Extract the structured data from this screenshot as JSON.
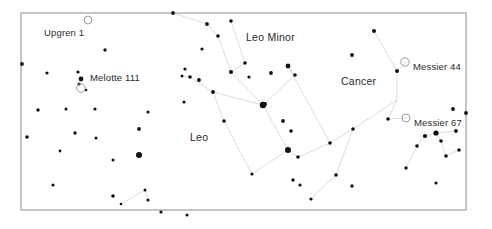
{
  "chart_data": {
    "type": "scatter",
    "title": "",
    "xlabel": "",
    "ylabel": "",
    "grid": false,
    "legend": null,
    "frame": {
      "x": 21,
      "y": 13,
      "width": 445,
      "height": 197
    },
    "xlim": [
      21,
      466
    ],
    "ylim": [
      13,
      210
    ],
    "constellation_labels": [
      {
        "name": "Leo Minor",
        "x": 246,
        "y": 41
      },
      {
        "name": "Cancer",
        "x": 341,
        "y": 85
      },
      {
        "name": "Leo",
        "x": 190,
        "y": 141
      }
    ],
    "object_labels": [
      {
        "name": "Upgren 1",
        "x": 44,
        "y": 36,
        "marker_x": 88,
        "marker_y": 20,
        "marker": "open-circle",
        "marker_r": 4.0
      },
      {
        "name": "Melotte 111",
        "x": 90,
        "y": 81,
        "marker_x": 81,
        "marker_y": 88,
        "marker": "open-circle",
        "marker_r": 4.2
      },
      {
        "name": "Messier 44",
        "x": 413,
        "y": 70,
        "marker_x": 405,
        "marker_y": 62,
        "marker": "open-circle",
        "marker_r": 4.2
      },
      {
        "name": "Messier 67",
        "x": 414,
        "y": 126,
        "marker_x": 406,
        "marker_y": 118,
        "marker": "open-circle",
        "marker_r": 4.0
      }
    ],
    "stars": [
      {
        "x": 22,
        "y": 64,
        "r": 1.9
      },
      {
        "x": 47,
        "y": 73,
        "r": 1.6
      },
      {
        "x": 38,
        "y": 110,
        "r": 1.7
      },
      {
        "x": 78,
        "y": 72,
        "r": 1.6
      },
      {
        "x": 81,
        "y": 79,
        "r": 2.4
      },
      {
        "x": 79,
        "y": 84,
        "r": 1.6
      },
      {
        "x": 86,
        "y": 90,
        "r": 1.3
      },
      {
        "x": 105,
        "y": 50,
        "r": 1.7
      },
      {
        "x": 95,
        "y": 109,
        "r": 1.6
      },
      {
        "x": 66,
        "y": 109,
        "r": 1.5
      },
      {
        "x": 27,
        "y": 137,
        "r": 1.8
      },
      {
        "x": 75,
        "y": 133,
        "r": 1.7
      },
      {
        "x": 96,
        "y": 138,
        "r": 1.5
      },
      {
        "x": 53,
        "y": 185,
        "r": 1.6
      },
      {
        "x": 113,
        "y": 196,
        "r": 1.8
      },
      {
        "x": 121,
        "y": 204,
        "r": 1.3
      },
      {
        "x": 148,
        "y": 200,
        "r": 1.6
      },
      {
        "x": 145,
        "y": 190,
        "r": 1.5
      },
      {
        "x": 139,
        "y": 155,
        "r": 3.0
      },
      {
        "x": 139,
        "y": 129,
        "r": 1.9
      },
      {
        "x": 148,
        "y": 112,
        "r": 1.6
      },
      {
        "x": 173,
        "y": 13,
        "r": 1.9
      },
      {
        "x": 184,
        "y": 102,
        "r": 1.6
      },
      {
        "x": 207,
        "y": 24,
        "r": 1.9
      },
      {
        "x": 231,
        "y": 21,
        "r": 1.8
      },
      {
        "x": 218,
        "y": 36,
        "r": 1.8
      },
      {
        "x": 202,
        "y": 49,
        "r": 1.6
      },
      {
        "x": 185,
        "y": 69,
        "r": 1.6
      },
      {
        "x": 182,
        "y": 76,
        "r": 1.5
      },
      {
        "x": 190,
        "y": 77,
        "r": 1.8
      },
      {
        "x": 199,
        "y": 80,
        "r": 1.9
      },
      {
        "x": 213,
        "y": 92,
        "r": 1.9
      },
      {
        "x": 224,
        "y": 121,
        "r": 1.8
      },
      {
        "x": 231,
        "y": 72,
        "r": 2.0
      },
      {
        "x": 245,
        "y": 63,
        "r": 1.8
      },
      {
        "x": 249,
        "y": 77,
        "r": 1.6
      },
      {
        "x": 263,
        "y": 105,
        "r": 3.2
      },
      {
        "x": 265,
        "y": 104,
        "r": 2.0
      },
      {
        "x": 271,
        "y": 73,
        "r": 1.9
      },
      {
        "x": 288,
        "y": 66,
        "r": 2.4
      },
      {
        "x": 295,
        "y": 75,
        "r": 1.8
      },
      {
        "x": 283,
        "y": 121,
        "r": 1.9
      },
      {
        "x": 288,
        "y": 150,
        "r": 3.0
      },
      {
        "x": 293,
        "y": 180,
        "r": 1.7
      },
      {
        "x": 300,
        "y": 185,
        "r": 1.6
      },
      {
        "x": 311,
        "y": 199,
        "r": 1.6
      },
      {
        "x": 291,
        "y": 131,
        "r": 1.8
      },
      {
        "x": 298,
        "y": 157,
        "r": 1.8
      },
      {
        "x": 330,
        "y": 143,
        "r": 1.8
      },
      {
        "x": 353,
        "y": 129,
        "r": 1.8
      },
      {
        "x": 336,
        "y": 175,
        "r": 1.8
      },
      {
        "x": 352,
        "y": 186,
        "r": 1.7
      },
      {
        "x": 374,
        "y": 31,
        "r": 2.0
      },
      {
        "x": 352,
        "y": 55,
        "r": 1.9
      },
      {
        "x": 397,
        "y": 71,
        "r": 2.0
      },
      {
        "x": 388,
        "y": 119,
        "r": 1.8
      },
      {
        "x": 406,
        "y": 168,
        "r": 1.7
      },
      {
        "x": 417,
        "y": 146,
        "r": 1.8
      },
      {
        "x": 425,
        "y": 136,
        "r": 2.1
      },
      {
        "x": 436,
        "y": 133,
        "r": 2.6
      },
      {
        "x": 441,
        "y": 141,
        "r": 1.8
      },
      {
        "x": 446,
        "y": 156,
        "r": 1.8
      },
      {
        "x": 456,
        "y": 131,
        "r": 1.9
      },
      {
        "x": 459,
        "y": 150,
        "r": 1.8
      },
      {
        "x": 436,
        "y": 183,
        "r": 1.6
      },
      {
        "x": 453,
        "y": 109,
        "r": 1.9
      },
      {
        "x": 466,
        "y": 113,
        "r": 1.9
      },
      {
        "x": 161,
        "y": 212,
        "r": 1.6
      },
      {
        "x": 187,
        "y": 215,
        "r": 1.5
      },
      {
        "x": 252,
        "y": 174,
        "r": 1.6
      },
      {
        "x": 113,
        "y": 160,
        "r": 1.5
      },
      {
        "x": 60,
        "y": 151,
        "r": 1.4
      }
    ],
    "constellation_lines": [
      {
        "name": "leo-sickle",
        "points": [
          [
            207,
            24
          ],
          [
            218,
            36
          ],
          [
            231,
            72
          ],
          [
            245,
            63
          ],
          [
            231,
            21
          ]
        ]
      },
      {
        "name": "leo-body-a",
        "points": [
          [
            231,
            72
          ],
          [
            263,
            105
          ],
          [
            288,
            150
          ]
        ]
      },
      {
        "name": "leo-body-b",
        "points": [
          [
            263,
            105
          ],
          [
            213,
            92
          ],
          [
            190,
            77
          ],
          [
            182,
            76
          ]
        ]
      },
      {
        "name": "leo-tail",
        "points": [
          [
            288,
            150
          ],
          [
            298,
            157
          ],
          [
            330,
            143
          ],
          [
            288,
            66
          ]
        ]
      },
      {
        "name": "leo-lower",
        "points": [
          [
            213,
            92
          ],
          [
            224,
            121
          ],
          [
            252,
            174
          ],
          [
            288,
            150
          ]
        ]
      },
      {
        "name": "leo-minor-line",
        "points": [
          [
            173,
            13
          ],
          [
            207,
            24
          ]
        ]
      },
      {
        "name": "leo-minor-arc",
        "points": [
          [
            263,
            105
          ],
          [
            295,
            75
          ],
          [
            288,
            66
          ]
        ]
      },
      {
        "name": "cancer-spine",
        "points": [
          [
            374,
            31
          ],
          [
            397,
            71
          ],
          [
            397,
            100
          ],
          [
            388,
            119
          ]
        ]
      },
      {
        "name": "cancer-branch-a",
        "points": [
          [
            397,
            71
          ],
          [
            406,
            62
          ]
        ]
      },
      {
        "name": "cancer-branch-b",
        "points": [
          [
            397,
            100
          ],
          [
            353,
            129
          ],
          [
            330,
            143
          ]
        ]
      },
      {
        "name": "cancer-branch-c",
        "points": [
          [
            388,
            119
          ],
          [
            406,
            118
          ]
        ]
      },
      {
        "name": "m67-chain",
        "points": [
          [
            406,
            168
          ],
          [
            417,
            146
          ],
          [
            425,
            136
          ],
          [
            436,
            133
          ],
          [
            456,
            131
          ]
        ]
      },
      {
        "name": "m67-chain-b",
        "points": [
          [
            436,
            133
          ],
          [
            441,
            141
          ],
          [
            446,
            156
          ],
          [
            459,
            150
          ]
        ]
      },
      {
        "name": "bottom-left-chain",
        "points": [
          [
            121,
            204
          ],
          [
            145,
            190
          ],
          [
            148,
            200
          ]
        ]
      },
      {
        "name": "right-descend",
        "points": [
          [
            353,
            129
          ],
          [
            336,
            175
          ],
          [
            311,
            199
          ]
        ]
      }
    ]
  }
}
